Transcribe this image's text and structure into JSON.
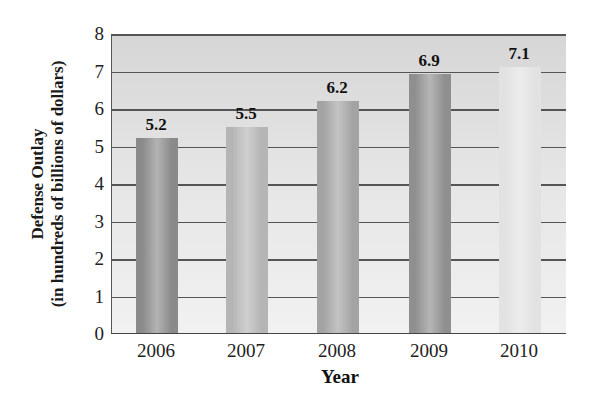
{
  "chart_data": {
    "type": "bar",
    "title": "",
    "xlabel": "Year",
    "ylabel": "Defense Outlay (in hundreds of billions of dollars)",
    "ylabel_lines": [
      "Defense Outlay",
      "(in hundreds of billions of dollars)"
    ],
    "categories": [
      "2006",
      "2007",
      "2008",
      "2009",
      "2010"
    ],
    "values": [
      5.2,
      5.5,
      6.2,
      6.9,
      7.1
    ],
    "data_labels": [
      "5.2",
      "5.5",
      "6.2",
      "6.9",
      "7.1"
    ],
    "ylim": [
      0,
      8
    ],
    "yticks": [
      "0",
      "1",
      "2",
      "3",
      "4",
      "5",
      "6",
      "7",
      "8"
    ],
    "grid": true,
    "legend": null,
    "bar_colors": [
      "#8a8a8a",
      "#b5b5b5",
      "#a3a3a3",
      "#8f8f8f",
      "#e2e2e2"
    ]
  }
}
